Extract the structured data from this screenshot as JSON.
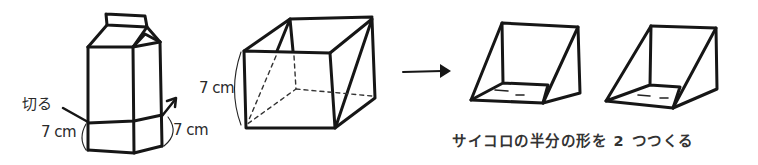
{
  "figure": {
    "ink_color": "#161616",
    "background": "#ffffff"
  },
  "step1_carton": {
    "cut_label": "切る",
    "height_label": "7 cm",
    "width_label": "7 cm"
  },
  "step2_cube": {
    "height_label": "7 cm"
  },
  "arrow": {
    "icon": "right-arrow"
  },
  "step3_halves": {
    "caption": "サイコロの半分の形を 2 つつくる"
  }
}
